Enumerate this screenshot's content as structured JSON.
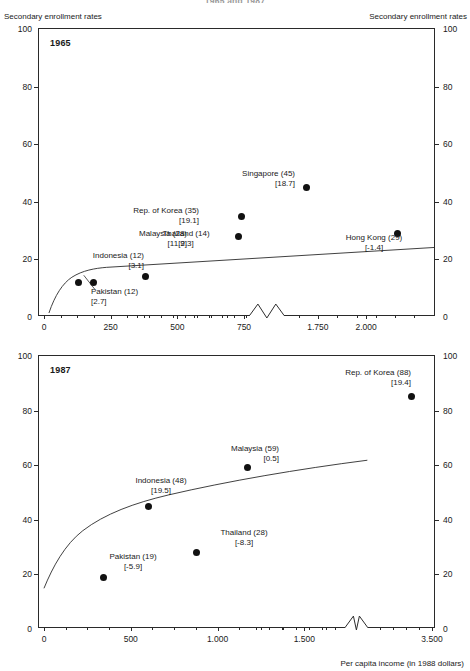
{
  "figure": {
    "title": "1965 and 1987",
    "y_axis_caption_left": "Secondary enrollment rates",
    "y_axis_caption_right": "Secondary enrollment rates",
    "x_axis_title": "Per capita income (in 1988 dollars)"
  },
  "chart_data": [
    {
      "type": "scatter",
      "title": "1965",
      "panel_label": "1965",
      "xlabel": "",
      "ylabel": "Secondary enrollment rates",
      "xlim": [
        0,
        2300
      ],
      "ylim": [
        0,
        100
      ],
      "axis_break": true,
      "grid": false,
      "legend": "none",
      "yticks": [
        0,
        20,
        40,
        60,
        80,
        100
      ],
      "ytick_labels": [
        "0",
        "20",
        "40",
        "60",
        "80",
        "100"
      ],
      "xticks": [
        0,
        250,
        500,
        750,
        1750,
        2000
      ],
      "xtick_labels": [
        "0",
        "250",
        "500",
        "750",
        "1.750",
        "2.000"
      ],
      "points": [
        {
          "name": "Indonesia",
          "x": 130,
          "y": 12,
          "enrollment": 12,
          "growth": 3.1,
          "label": "Indonesia (12)",
          "value_label": "[3.1]",
          "anchor": "left-stack"
        },
        {
          "name": "Pakistan",
          "x": 185,
          "y": 12,
          "enrollment": 12,
          "growth": 2.7,
          "label": "Pakistan (12)",
          "value_label": "[2.7]",
          "anchor": "below-leader"
        },
        {
          "name": "Thailand",
          "x": 380,
          "y": 14,
          "enrollment": 14,
          "growth": 2.3,
          "label": "Thailand (14)",
          "value_label": "[2.3]",
          "anchor": "above"
        },
        {
          "name": "Malaysia",
          "x": 730,
          "y": 28,
          "enrollment": 28,
          "growth": 11.9,
          "label": "Malaysia (28)",
          "value_label": "[11.9]",
          "anchor": "left"
        },
        {
          "name": "Rep. of Korea",
          "x": 740,
          "y": 35,
          "enrollment": 35,
          "growth": 19.1,
          "label": "Rep. of Korea (35)",
          "value_label": "[19.1]",
          "anchor": "left"
        },
        {
          "name": "Singapore",
          "x": 1690,
          "y": 45,
          "enrollment": 45,
          "growth": 18.7,
          "label": "Singapore (45)",
          "value_label": "[18.7]",
          "anchor": "left"
        },
        {
          "name": "Hong Kong",
          "x": 2160,
          "y": 29,
          "enrollment": 29,
          "growth": -1.4,
          "label": "Hong Kong (29)",
          "value_label": "[-1.4]",
          "anchor": "below"
        }
      ],
      "fit_curve_note": "logarithmic regression line rising from ~0 at low income to ~31 at high income"
    },
    {
      "type": "scatter",
      "title": "1987",
      "panel_label": "1987",
      "xlabel": "Per capita income (in 1988 dollars)",
      "ylabel": "Secondary enrollment rates",
      "xlim": [
        0,
        3500
      ],
      "ylim": [
        0,
        100
      ],
      "axis_break": true,
      "grid": false,
      "legend": "none",
      "yticks": [
        0,
        20,
        40,
        60,
        80,
        100
      ],
      "ytick_labels": [
        "0",
        "20",
        "40",
        "60",
        "80",
        "100"
      ],
      "xticks": [
        0,
        500,
        1000,
        1500,
        3500
      ],
      "xtick_labels": [
        "0",
        "500",
        "1.000",
        "1.500",
        "3.500"
      ],
      "points": [
        {
          "name": "Pakistan",
          "x": 340,
          "y": 19,
          "enrollment": 19,
          "growth": -5.9,
          "label": "Pakistan (19)",
          "value_label": "[-5.9]",
          "anchor": "above-right"
        },
        {
          "name": "Indonesia",
          "x": 600,
          "y": 45,
          "enrollment": 48,
          "growth": 19.5,
          "label": "Indonesia (48)",
          "value_label": "[19.5]",
          "anchor": "above-right"
        },
        {
          "name": "Thailand",
          "x": 880,
          "y": 28,
          "enrollment": 28,
          "growth": -8.3,
          "label": "Thailand (28)",
          "value_label": "[-8.3]",
          "anchor": "above-right"
        },
        {
          "name": "Malaysia",
          "x": 1740,
          "y": 59,
          "enrollment": 59,
          "growth": 0.5,
          "label": "Malaysia (59)",
          "value_label": "[0.5]",
          "anchor": "left"
        },
        {
          "name": "Rep. of Korea",
          "x": 3300,
          "y": 85,
          "enrollment": 88,
          "growth": 19.4,
          "label": "Rep. of Korea (88)",
          "value_label": "[19.4]",
          "anchor": "left"
        }
      ],
      "fit_curve_note": "logarithmic regression curve rising from ~14 at low income to ~62 at high income"
    }
  ]
}
